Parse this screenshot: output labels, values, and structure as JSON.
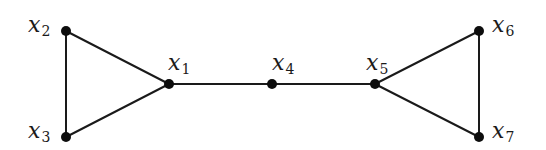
{
  "diagram": {
    "type": "graph",
    "nodes": [
      {
        "id": "x1",
        "base": "x",
        "sub": "1",
        "x": 169,
        "y": 84,
        "lx": 168,
        "ly": 70
      },
      {
        "id": "x2",
        "base": "x",
        "sub": "2",
        "x": 66,
        "y": 31,
        "lx": 28,
        "ly": 32
      },
      {
        "id": "x3",
        "base": "x",
        "sub": "3",
        "x": 66,
        "y": 137,
        "lx": 28,
        "ly": 138
      },
      {
        "id": "x4",
        "base": "x",
        "sub": "4",
        "x": 272,
        "y": 84,
        "lx": 272,
        "ly": 70
      },
      {
        "id": "x5",
        "base": "x",
        "sub": "5",
        "x": 375,
        "y": 84,
        "lx": 366,
        "ly": 70
      },
      {
        "id": "x6",
        "base": "x",
        "sub": "6",
        "x": 479,
        "y": 31,
        "lx": 492,
        "ly": 32
      },
      {
        "id": "x7",
        "base": "x",
        "sub": "7",
        "x": 479,
        "y": 137,
        "lx": 492,
        "ly": 138
      }
    ],
    "edges": [
      {
        "from": "x2",
        "to": "x3"
      },
      {
        "from": "x2",
        "to": "x1"
      },
      {
        "from": "x3",
        "to": "x1"
      },
      {
        "from": "x1",
        "to": "x4"
      },
      {
        "from": "x4",
        "to": "x5"
      },
      {
        "from": "x5",
        "to": "x6"
      },
      {
        "from": "x5",
        "to": "x7"
      },
      {
        "from": "x6",
        "to": "x7"
      }
    ],
    "colors": {
      "edge": "#1a1a1a",
      "node": "#0d0d0d",
      "background": "#ffffff"
    }
  }
}
